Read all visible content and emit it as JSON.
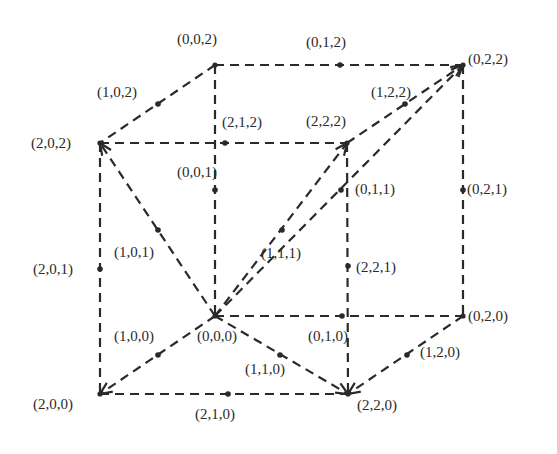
{
  "diagram": {
    "type": "lattice-cube",
    "colors": {
      "line": "#2a2a2a",
      "background": "#ffffff"
    },
    "nodes": [
      {
        "id": "002",
        "label": "(0,0,2)",
        "x": 215,
        "y": 65,
        "lx": 177,
        "ly": 44,
        "corner": true
      },
      {
        "id": "022",
        "label": "(0,2,2)",
        "x": 463,
        "y": 65,
        "lx": 468,
        "ly": 64,
        "corner": true
      },
      {
        "id": "202",
        "label": "(2,0,2)",
        "x": 100,
        "y": 143,
        "lx": 31,
        "ly": 148,
        "corner": true
      },
      {
        "id": "222",
        "label": "(2,2,2)",
        "x": 347,
        "y": 143,
        "lx": 306,
        "ly": 126,
        "corner": true
      },
      {
        "id": "000",
        "label": "(0,0,0)",
        "x": 215,
        "y": 316,
        "lx": 197,
        "ly": 341,
        "corner": true
      },
      {
        "id": "020",
        "label": "(0,2,0)",
        "x": 463,
        "y": 316,
        "lx": 468,
        "ly": 321,
        "corner": true
      },
      {
        "id": "200",
        "label": "(2,0,0)",
        "x": 100,
        "y": 394,
        "lx": 33,
        "ly": 409,
        "corner": true
      },
      {
        "id": "220",
        "label": "(2,2,0)",
        "x": 348,
        "y": 394,
        "lx": 357,
        "ly": 410,
        "corner": true
      },
      {
        "id": "012",
        "label": "(0,1,2)",
        "x": 340,
        "y": 65,
        "lx": 306,
        "ly": 47,
        "corner": false
      },
      {
        "id": "102",
        "label": "(1,0,2)",
        "x": 158,
        "y": 104,
        "lx": 97,
        "ly": 97,
        "corner": false
      },
      {
        "id": "122",
        "label": "(1,2,2)",
        "x": 405,
        "y": 104,
        "lx": 371,
        "ly": 97,
        "corner": false
      },
      {
        "id": "212",
        "label": "(2,1,2)",
        "x": 225,
        "y": 143,
        "lx": 222,
        "ly": 127,
        "corner": false
      },
      {
        "id": "001",
        "label": "(0,0,1)",
        "x": 215,
        "y": 190,
        "lx": 177,
        "ly": 177,
        "corner": false
      },
      {
        "id": "011",
        "label": "(0,1,1)",
        "x": 341,
        "y": 190,
        "lx": 355,
        "ly": 194,
        "corner": false
      },
      {
        "id": "021",
        "label": "(0,2,1)",
        "x": 463,
        "y": 190,
        "lx": 467,
        "ly": 194,
        "corner": false
      },
      {
        "id": "101",
        "label": "(1,0,1)",
        "x": 158,
        "y": 230,
        "lx": 114,
        "ly": 257,
        "corner": false
      },
      {
        "id": "111",
        "label": "(1,1,1)",
        "x": 282,
        "y": 230,
        "lx": 261,
        "ly": 258,
        "corner": false
      },
      {
        "id": "201",
        "label": "(2,0,1)",
        "x": 100,
        "y": 269,
        "lx": 33,
        "ly": 274,
        "corner": false
      },
      {
        "id": "221",
        "label": "(2,2,1)",
        "x": 348,
        "y": 266,
        "lx": 356,
        "ly": 272,
        "corner": false
      },
      {
        "id": "100",
        "label": "(1,0,0)",
        "x": 158,
        "y": 355,
        "lx": 114,
        "ly": 341,
        "corner": false
      },
      {
        "id": "010",
        "label": "(0,1,0)",
        "x": 342,
        "y": 316,
        "lx": 308,
        "ly": 341,
        "corner": false
      },
      {
        "id": "110",
        "label": "(1,1,0)",
        "x": 280,
        "y": 355,
        "lx": 245,
        "ly": 374,
        "corner": false
      },
      {
        "id": "120",
        "label": "(1,2,0)",
        "x": 407,
        "y": 355,
        "lx": 420,
        "ly": 357,
        "corner": false
      },
      {
        "id": "210",
        "label": "(2,1,0)",
        "x": 228,
        "y": 394,
        "lx": 195,
        "ly": 419,
        "corner": false
      }
    ],
    "edges": [
      {
        "from": "002",
        "to": "022",
        "arrow": false
      },
      {
        "from": "002",
        "to": "202",
        "arrow": false
      },
      {
        "from": "202",
        "to": "222",
        "arrow": false
      },
      {
        "from": "002",
        "to": "000",
        "arrow": false
      },
      {
        "from": "022",
        "to": "020",
        "arrow": false
      },
      {
        "from": "222",
        "to": "220",
        "arrow": false
      },
      {
        "from": "202",
        "to": "200",
        "arrow": false
      },
      {
        "from": "000",
        "to": "020",
        "arrow": false
      },
      {
        "from": "200",
        "to": "220",
        "arrow": false
      },
      {
        "from": "020",
        "to": "220",
        "arrow": true
      },
      {
        "from": "000",
        "to": "202",
        "arrow": true
      },
      {
        "from": "000",
        "to": "200",
        "arrow": true
      },
      {
        "from": "000",
        "to": "220",
        "arrow": true
      },
      {
        "from": "000",
        "to": "222",
        "arrow": true
      },
      {
        "from": "000",
        "to": "022",
        "arrow": true
      },
      {
        "from": "222",
        "to": "022",
        "arrow": true
      },
      {
        "from": "002",
        "to": "002",
        "arrow": true
      },
      {
        "from": "202",
        "to": "202",
        "arrow": true
      }
    ]
  }
}
